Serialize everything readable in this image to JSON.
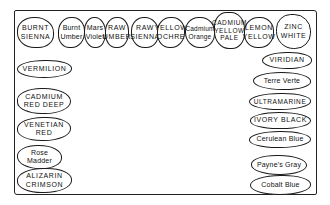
{
  "diagram": {
    "title": "",
    "container": "palette outline",
    "top_row": [
      {
        "label": "BURNT\nSIENNA"
      },
      {
        "label": "Burnt\nUmber"
      },
      {
        "label": "Mars\nViolet"
      },
      {
        "label": "RAW\nUMBER"
      },
      {
        "label": "RAW\nSIENNA"
      },
      {
        "label": "YELLOW\nOCHRE"
      },
      {
        "label": "Cadmium\nOrange"
      },
      {
        "label": "CADMIUM\nYELLOW\nPALE"
      },
      {
        "label": "LEMON\nYELLOW"
      },
      {
        "label": "ZINC\nWHITE"
      }
    ],
    "left_column": [
      {
        "label": "VERMILION"
      },
      {
        "label": "CADMIUM\nRED DEEP"
      },
      {
        "label": "VENETIAN\nRED"
      },
      {
        "label": "Rose\nMadder"
      },
      {
        "label": "ALIZARIN\nCRIMSON"
      }
    ],
    "right_column": [
      {
        "label": "VIRIDIAN"
      },
      {
        "label": "Terre Verte"
      },
      {
        "label": "ULTRAMARINE"
      },
      {
        "label": "IVORY BLACK"
      },
      {
        "label": "Cerulean Blue"
      },
      {
        "label": "Payne's Gray"
      },
      {
        "label": "Cobalt Blue"
      }
    ],
    "colors": {
      "ink": "#1a1a1a",
      "background": "#ffffff"
    }
  }
}
